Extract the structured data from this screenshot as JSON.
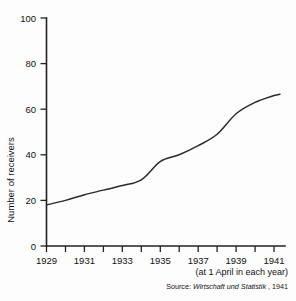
{
  "chart_data": {
    "type": "line",
    "title": "",
    "subtitle": "",
    "xlabel": "",
    "ylabel": "Number of receivers",
    "x": [
      1929,
      1930,
      1931,
      1932,
      1933,
      1934,
      1935,
      1936,
      1937,
      1938,
      1939,
      1940,
      1941
    ],
    "series": [
      {
        "name": "Number of receivers",
        "values": [
          18,
          20,
          22.5,
          24.5,
          26.5,
          29,
          37,
          40,
          44,
          49,
          58,
          63,
          66
        ]
      }
    ],
    "xlim": [
      1929,
      1941.4
    ],
    "ylim": [
      0,
      100
    ],
    "xticks": [
      1929,
      1930,
      1931,
      1932,
      1933,
      1934,
      1935,
      1936,
      1937,
      1938,
      1939,
      1940,
      1941
    ],
    "xtick_labels": [
      "1929",
      "",
      "1931",
      "",
      "1933",
      "",
      "1935",
      "",
      "1937",
      "",
      "1939",
      "",
      "1941"
    ],
    "yticks": [
      0,
      20,
      40,
      60,
      80,
      100
    ],
    "ytick_labels": [
      "0",
      "20",
      "40",
      "60",
      "80",
      "100"
    ],
    "grid": false,
    "legend": false,
    "legend_position": "none",
    "annotations": [
      "(at 1 April in each year)",
      "Source: Wirtschaft und Statistik, 1941"
    ]
  },
  "axis": {
    "y_title": "Number of receivers",
    "y_labels": {
      "t0": "0",
      "t20": "20",
      "t40": "40",
      "t60": "60",
      "t80": "80",
      "t100": "100"
    },
    "x_labels": {
      "y1929": "1929",
      "y1931": "1931",
      "y1933": "1933",
      "y1935": "1935",
      "y1937": "1937",
      "y1939": "1939",
      "y1941": "1941"
    }
  },
  "footnotes": {
    "period_note": "(at 1 April in each year)",
    "source_prefix": "Source:",
    "source_publication": "Wirtschaft und Statistik",
    "source_year": ", 1941"
  },
  "colors": {
    "line": "#2b2b2b",
    "axis": "#222222",
    "text": "#111111",
    "background": "#fdfdfd"
  }
}
